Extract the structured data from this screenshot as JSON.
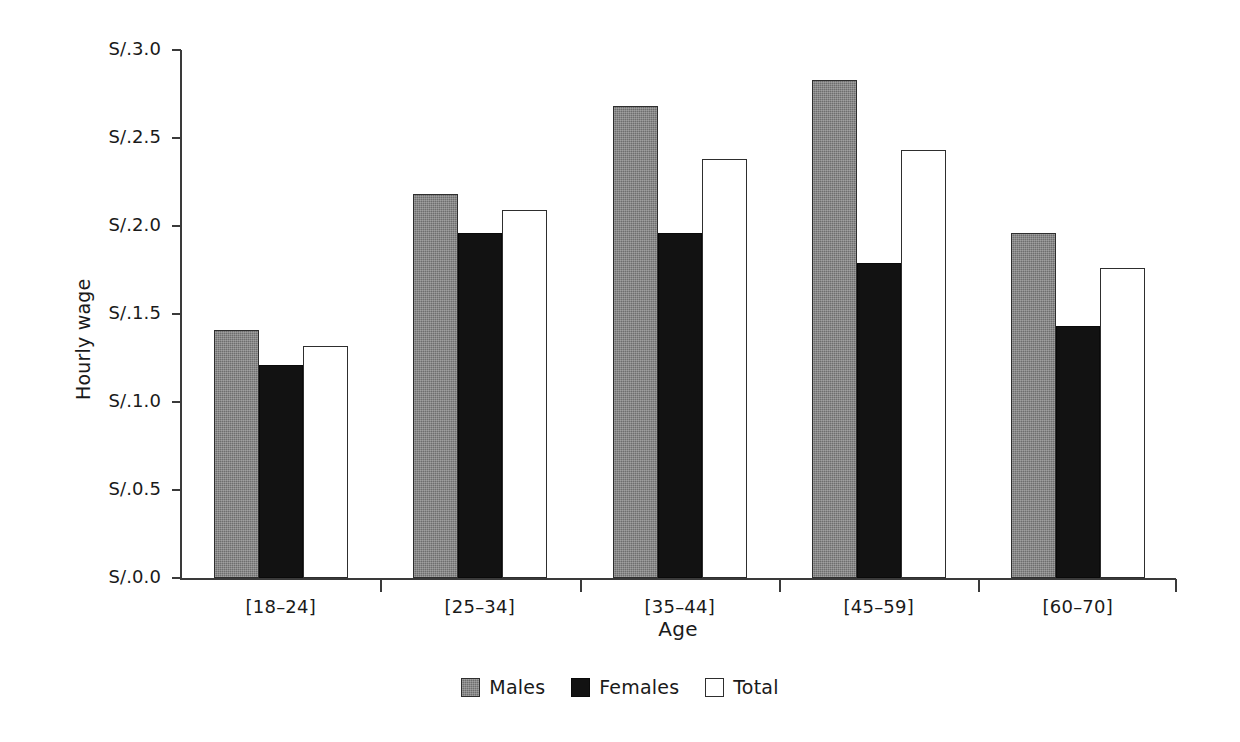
{
  "chart_data": {
    "type": "bar",
    "title": "",
    "xlabel": "Age",
    "ylabel": "Hourly wage",
    "categories": [
      "[18–24]",
      "[25–34]",
      "[35–44]",
      "[45–59]",
      "[60–70]"
    ],
    "series": [
      {
        "name": "Males",
        "color": "#6e6e6e",
        "values": [
          1.41,
          2.18,
          2.68,
          2.83,
          1.96
        ]
      },
      {
        "name": "Females",
        "color": "#121212",
        "values": [
          1.21,
          1.96,
          1.96,
          1.79,
          1.43
        ]
      },
      {
        "name": "Total",
        "color": "#ffffff",
        "values": [
          1.32,
          2.09,
          2.38,
          2.43,
          1.76
        ]
      }
    ],
    "ylim": [
      0.0,
      3.0
    ],
    "ytick_values": [
      0.0,
      0.5,
      1.0,
      1.5,
      2.0,
      2.5,
      3.0
    ],
    "ytick_labels": [
      "S/.0.0",
      "S/.0.5",
      "S/.1.0",
      "S/.1.5",
      "S/.2.0",
      "S/.2.5",
      "S/.3.0"
    ],
    "grid": false,
    "legend_position": "bottom-center",
    "currency_prefix": "S/."
  },
  "legend": {
    "items": [
      {
        "label": "Males",
        "swatch": "males-swatch"
      },
      {
        "label": "Females",
        "swatch": "females-swatch"
      },
      {
        "label": "Total",
        "swatch": "total-swatch"
      }
    ]
  },
  "axes": {
    "y_title": "Hourly wage",
    "x_title": "Age"
  },
  "colors": {
    "males": "#6e6e6e",
    "females": "#121212",
    "total": "#ffffff",
    "axis": "#3a3a3a",
    "text": "#1a1a1a",
    "background": "#ffffff"
  }
}
